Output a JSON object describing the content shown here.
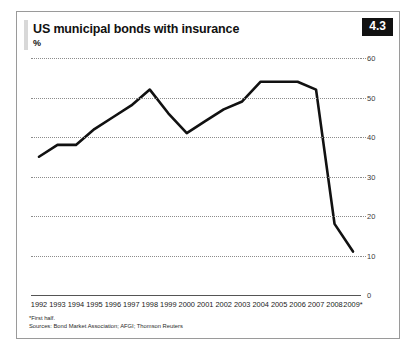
{
  "figure": {
    "badge": "4.3",
    "title": "US municipal bonds with insurance",
    "unit": "%",
    "footnote": "*First half.",
    "sources": "Sources: Bond Market Association; AFGI; Thomson Reuters"
  },
  "chart_data": {
    "type": "line",
    "title": "US municipal bonds with insurance",
    "subtitle": "",
    "xlabel": "",
    "ylabel": "%",
    "ylim": [
      0,
      60
    ],
    "yticks": [
      0,
      10,
      20,
      30,
      40,
      50,
      60
    ],
    "grid": true,
    "legend": null,
    "line_color": "#111111",
    "categories": [
      "1992",
      "1993",
      "1994",
      "1995",
      "1996",
      "1997",
      "1998",
      "1999",
      "2000",
      "2001",
      "2002",
      "2003",
      "2004",
      "2005",
      "2006",
      "2007",
      "2008",
      "2009*"
    ],
    "values": [
      35,
      38,
      38,
      42,
      45,
      48,
      52,
      46,
      41,
      44,
      47,
      49,
      54,
      54,
      54,
      52,
      18,
      11
    ],
    "annotations": [
      "*First half."
    ]
  }
}
